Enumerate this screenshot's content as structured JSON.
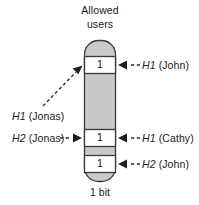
{
  "figure": {
    "title_line1": "Allowed",
    "title_line2": "users",
    "caption": "1 bit",
    "bit_value": "1",
    "colors": {
      "fill_gray": "#c9c9c9",
      "cell_white": "#ffffff",
      "stroke": "#333333",
      "text": "#1a1a1a"
    }
  },
  "cells": [
    {
      "name": "cell-top",
      "value": "1"
    },
    {
      "name": "cell-middle",
      "value": "1"
    },
    {
      "name": "cell-bottom",
      "value": "1"
    }
  ],
  "annotations": {
    "right": [
      {
        "name": "label-h1-john",
        "hash": "H1",
        "user": "(John)"
      },
      {
        "name": "label-h1-cathy",
        "hash": "H1",
        "user": "(Cathy)"
      },
      {
        "name": "label-h2-john",
        "hash": "H2",
        "user": "(John)"
      }
    ],
    "left": [
      {
        "name": "label-h1-jonas",
        "hash": "H1",
        "user": "(Jonas)"
      },
      {
        "name": "label-h2-jonas",
        "hash": "H2",
        "user": "(Jonas)"
      }
    ]
  }
}
